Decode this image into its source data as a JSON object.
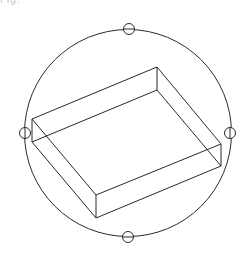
{
  "diagram": {
    "type": "wireframe-box-with-rotation-gizmo",
    "clipped_label": "Fig.",
    "stroke_color": "#2a2a2a",
    "background": "#ffffff",
    "rotation_circle": {
      "cx": 128,
      "cy": 133,
      "r": 103.5
    },
    "handles": [
      {
        "name": "top",
        "cx": 129,
        "cy": 29,
        "r": 5.5
      },
      {
        "name": "left",
        "cx": 25,
        "cy": 133,
        "r": 5.5
      },
      {
        "name": "right",
        "cx": 230,
        "cy": 133,
        "r": 5.5
      },
      {
        "name": "bottom",
        "cx": 128,
        "cy": 237,
        "r": 5.5
      }
    ],
    "box": {
      "top_face": [
        [
          32,
          119
        ],
        [
          157,
          67
        ],
        [
          221,
          144
        ],
        [
          96,
          195
        ]
      ],
      "bottom_face": [
        [
          32,
          142
        ],
        [
          157,
          90
        ],
        [
          221,
          166
        ],
        [
          96,
          218
        ]
      ]
    }
  }
}
